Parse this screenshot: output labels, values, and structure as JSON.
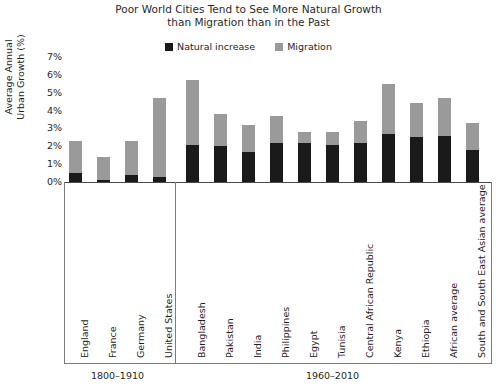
{
  "chart_data": {
    "type": "bar",
    "subtype": "stacked-bar",
    "title": "Poor World Cities Tend to See More Natural Growth than Migration than in the Past",
    "title_lines": [
      "Poor World Cities Tend to See More Natural Growth",
      "than Migration than in the Past"
    ],
    "xlabel": "",
    "ylabel": "Average Annual Urban Growth (%)",
    "ylabel_lines": [
      "Average Annual",
      "Urban Growth (%)"
    ],
    "ylim": [
      0,
      7
    ],
    "ytick_labels": [
      "0%",
      "1%",
      "2%",
      "3%",
      "4%",
      "5%",
      "6%",
      "7%"
    ],
    "ytick_values": [
      0,
      1,
      2,
      3,
      4,
      5,
      6,
      7
    ],
    "grid": false,
    "legend_position": "top-center",
    "categories": [
      "England",
      "France",
      "Germany",
      "United States",
      "Bangladesh",
      "Pakistan",
      "India",
      "Philippines",
      "Egypt",
      "Tunisia",
      "Central African Republic",
      "Kenya",
      "Ethiopia",
      "African average",
      "South and South East Asian average"
    ],
    "series": [
      {
        "name": "Natural increase",
        "color": "#1a1a1a",
        "values": [
          0.5,
          0.1,
          0.4,
          0.3,
          2.1,
          2.0,
          1.7,
          2.2,
          2.2,
          2.1,
          2.2,
          2.7,
          2.5,
          2.6,
          1.8
        ]
      },
      {
        "name": "Migration",
        "color": "#9a9a9a",
        "values": [
          1.8,
          1.3,
          1.9,
          4.4,
          3.6,
          1.8,
          1.5,
          1.5,
          0.6,
          0.7,
          1.2,
          2.8,
          1.9,
          2.1,
          1.5
        ]
      }
    ],
    "totals": [
      2.3,
      1.4,
      2.3,
      4.7,
      5.7,
      3.8,
      3.2,
      3.7,
      2.8,
      2.8,
      3.4,
      5.5,
      4.4,
      4.7,
      3.3
    ],
    "groups": [
      {
        "label": "1800–1910",
        "start_index": 0,
        "end_index": 3
      },
      {
        "label": "1960–2010",
        "start_index": 4,
        "end_index": 14
      }
    ]
  },
  "legend": {
    "items": [
      {
        "label": "Natural increase",
        "color": "#1a1a1a",
        "swatch_name": "legend-swatch-natural-increase"
      },
      {
        "label": "Migration",
        "color": "#9a9a9a",
        "swatch_name": "legend-swatch-migration"
      }
    ]
  }
}
